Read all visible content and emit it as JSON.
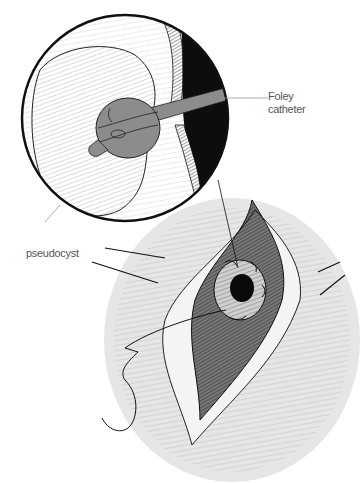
{
  "figure": {
    "labels": {
      "foley": [
        "Foley",
        "catheter"
      ],
      "pseudocyst": "pseudocyst"
    },
    "colors": {
      "background": "#ffffff",
      "skin_field": "#e6e6e6",
      "catheter": "#8c8c8c",
      "ink": "#111111",
      "leader": "#9a9a9a"
    }
  }
}
